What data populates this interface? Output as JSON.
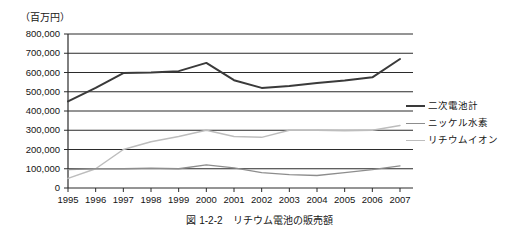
{
  "unit_label": "（百万円）",
  "caption": "図 1-2-2　リチウム電池の販売額",
  "legend": {
    "items": [
      {
        "label": "二次電池計",
        "color": "#3a3a3a"
      },
      {
        "label": "ニッケル水素",
        "color": "#8d8d8d"
      },
      {
        "label": "リチウムイオン",
        "color": "#bdbdbd"
      }
    ]
  },
  "chart_data": {
    "type": "line",
    "title": "図 1-2-2　リチウム電池の販売額",
    "xlabel": "",
    "ylabel": "（百万円）",
    "ylim": [
      0,
      800000
    ],
    "ytick_step": 100000,
    "ytick_labels": [
      "800,000",
      "700,000",
      "600,000",
      "500,000",
      "400,000",
      "300,000",
      "200,000",
      "100,000",
      "0"
    ],
    "grid": true,
    "legend_position": "right",
    "categories": [
      "1995",
      "1996",
      "1997",
      "1998",
      "1999",
      "2000",
      "2001",
      "2002",
      "2003",
      "2004",
      "2005",
      "2006",
      "2007"
    ],
    "series": [
      {
        "name": "二次電池計",
        "color": "#3a3a3a",
        "values": [
          450000,
          520000,
          597000,
          600000,
          607000,
          650000,
          560000,
          520000,
          530000,
          545000,
          558000,
          575000,
          670000
        ]
      },
      {
        "name": "ニッケル水素",
        "color": "#8d8d8d",
        "values": [
          95000,
          100000,
          100000,
          103000,
          100000,
          120000,
          105000,
          80000,
          70000,
          65000,
          80000,
          95000,
          115000
        ]
      },
      {
        "name": "リチウムイオン",
        "color": "#bdbdbd",
        "values": [
          50000,
          100000,
          200000,
          240000,
          268000,
          300000,
          268000,
          263000,
          300000,
          300000,
          298000,
          300000,
          325000
        ]
      }
    ]
  }
}
